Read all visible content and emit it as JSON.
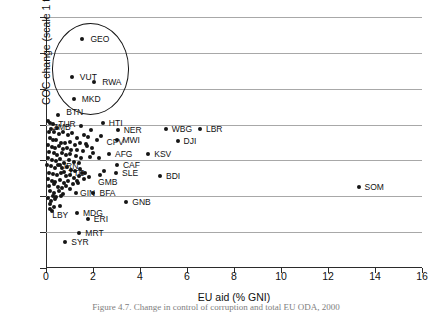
{
  "caption": "Figure 4.7. Change in control of corruption and total EU ODA, 2000",
  "chart_data": {
    "type": "scatter",
    "title": "",
    "xlabel": "EU aid (% GNI)",
    "ylabel": "COC change (scale 1 to 10)",
    "xlim": [
      0,
      16
    ],
    "ylim": [
      -3,
      4
    ],
    "xticks": [
      0,
      2,
      4,
      6,
      8,
      10,
      12,
      14,
      16
    ],
    "yticks": [
      -3,
      -2,
      -1,
      0,
      1,
      2,
      3,
      4
    ],
    "grid": "horizontal",
    "legend": "none",
    "marker": "filled-circle",
    "marker_color": "#151515",
    "annotations": [
      {
        "type": "ellipse",
        "name": "outlier-highlight-ellipse",
        "center_x": 1.9,
        "center_y": 2.55,
        "radius_x": 1.65,
        "radius_y": 1.27
      }
    ],
    "labeled_points": [
      {
        "label": "GEO",
        "x": 1.55,
        "y": 3.38,
        "lx": 8,
        "ly": -4
      },
      {
        "label": "VUT",
        "x": 1.1,
        "y": 2.33,
        "lx": 8,
        "ly": -4
      },
      {
        "label": "RWA",
        "x": 2.05,
        "y": 2.18,
        "lx": 8,
        "ly": -4
      },
      {
        "label": "MKD",
        "x": 1.18,
        "y": 1.71,
        "lx": 8,
        "ly": -4
      },
      {
        "label": "BTN",
        "x": 0.52,
        "y": 1.27,
        "lx": 8,
        "ly": -7
      },
      {
        "label": "TUR",
        "x": 0.18,
        "y": 1.05,
        "lx": 8,
        "ly": -3
      },
      {
        "label": "ZMB",
        "x": 1.48,
        "y": 0.95,
        "lx": -28,
        "ly": -3
      },
      {
        "label": "HTI",
        "x": 2.42,
        "y": 1.04,
        "lx": 6,
        "ly": -4
      },
      {
        "label": "NER",
        "x": 3.05,
        "y": 0.86,
        "lx": 6,
        "ly": -4
      },
      {
        "label": "WBG",
        "x": 5.1,
        "y": 0.88,
        "lx": 6,
        "ly": -4
      },
      {
        "label": "LBR",
        "x": 6.55,
        "y": 0.88,
        "lx": 6,
        "ly": -4
      },
      {
        "label": "CPV",
        "x": 2.32,
        "y": 0.68,
        "lx": 0,
        "ly": 2
      },
      {
        "label": "MWI",
        "x": 3.0,
        "y": 0.58,
        "lx": 6,
        "ly": -4
      },
      {
        "label": "DJI",
        "x": 5.6,
        "y": 0.55,
        "lx": 6,
        "ly": -4
      },
      {
        "label": "AFG",
        "x": 2.68,
        "y": 0.17,
        "lx": 6,
        "ly": -4
      },
      {
        "label": "KSV",
        "x": 4.35,
        "y": 0.17,
        "lx": 6,
        "ly": -4
      },
      {
        "label": "CAF",
        "x": 3.02,
        "y": -0.12,
        "lx": 6,
        "ly": -4
      },
      {
        "label": "SLE",
        "x": 2.98,
        "y": -0.36,
        "lx": 6,
        "ly": -4
      },
      {
        "label": "BDI",
        "x": 4.85,
        "y": -0.43,
        "lx": 6,
        "ly": -4
      },
      {
        "label": "GMB",
        "x": 2.3,
        "y": -0.4,
        "lx": -2,
        "ly": 3
      },
      {
        "label": "TTO",
        "x": 0.78,
        "y": -0.33,
        "lx": 4,
        "ly": -3
      },
      {
        "label": "IRN",
        "x": 0.58,
        "y": -0.13,
        "lx": 4,
        "ly": -3
      },
      {
        "label": "GIN",
        "x": 1.28,
        "y": -0.92,
        "lx": 4,
        "ly": -4
      },
      {
        "label": "BFA",
        "x": 2.02,
        "y": -0.92,
        "lx": 6,
        "ly": -4
      },
      {
        "label": "GNB",
        "x": 3.42,
        "y": -1.17,
        "lx": 6,
        "ly": -4
      },
      {
        "label": "SOM",
        "x": 13.3,
        "y": -0.75,
        "lx": 6,
        "ly": -4
      },
      {
        "label": "LBY",
        "x": 0.18,
        "y": -1.35,
        "lx": 2,
        "ly": 2
      },
      {
        "label": "MDG",
        "x": 1.32,
        "y": -1.48,
        "lx": 6,
        "ly": -4
      },
      {
        "label": "ERI",
        "x": 1.78,
        "y": -1.62,
        "lx": 6,
        "ly": -4
      },
      {
        "label": "MRT",
        "x": 1.42,
        "y": -2.02,
        "lx": 6,
        "ly": -4
      },
      {
        "label": "SYR",
        "x": 0.82,
        "y": -2.28,
        "lx": 6,
        "ly": -4
      }
    ],
    "unlabeled_points": [
      {
        "x": 0.09,
        "y": 1.1
      },
      {
        "x": 0.3,
        "y": 1.02
      },
      {
        "x": 0.22,
        "y": 0.88
      },
      {
        "x": 0.12,
        "y": 0.8
      },
      {
        "x": 0.36,
        "y": 0.78
      },
      {
        "x": 0.55,
        "y": 0.74
      },
      {
        "x": 0.74,
        "y": 0.8
      },
      {
        "x": 0.92,
        "y": 0.7
      },
      {
        "x": 1.12,
        "y": 0.76
      },
      {
        "x": 1.3,
        "y": 0.62
      },
      {
        "x": 1.62,
        "y": 0.7
      },
      {
        "x": 1.8,
        "y": 0.66
      },
      {
        "x": 0.16,
        "y": 0.62
      },
      {
        "x": 0.28,
        "y": 0.58
      },
      {
        "x": 0.44,
        "y": 0.56
      },
      {
        "x": 0.62,
        "y": 0.5
      },
      {
        "x": 0.82,
        "y": 0.48
      },
      {
        "x": 1.02,
        "y": 0.52
      },
      {
        "x": 1.22,
        "y": 0.44
      },
      {
        "x": 1.44,
        "y": 0.5
      },
      {
        "x": 1.7,
        "y": 0.46
      },
      {
        "x": 0.08,
        "y": 0.42
      },
      {
        "x": 0.24,
        "y": 0.38
      },
      {
        "x": 0.4,
        "y": 0.34
      },
      {
        "x": 0.56,
        "y": 0.4
      },
      {
        "x": 0.72,
        "y": 0.32
      },
      {
        "x": 0.9,
        "y": 0.36
      },
      {
        "x": 1.08,
        "y": 0.28
      },
      {
        "x": 1.34,
        "y": 0.3
      },
      {
        "x": 1.56,
        "y": 0.26
      },
      {
        "x": 2.0,
        "y": 0.22
      },
      {
        "x": 0.14,
        "y": 0.24
      },
      {
        "x": 0.32,
        "y": 0.2
      },
      {
        "x": 0.48,
        "y": 0.16
      },
      {
        "x": 0.66,
        "y": 0.22
      },
      {
        "x": 0.86,
        "y": 0.14
      },
      {
        "x": 1.04,
        "y": 0.18
      },
      {
        "x": 1.26,
        "y": 0.12
      },
      {
        "x": 1.5,
        "y": 0.08
      },
      {
        "x": 1.88,
        "y": 0.1
      },
      {
        "x": 0.1,
        "y": 0.06
      },
      {
        "x": 0.26,
        "y": 0.02
      },
      {
        "x": 0.42,
        "y": -0.02
      },
      {
        "x": 0.6,
        "y": 0.04
      },
      {
        "x": 0.78,
        "y": -0.06
      },
      {
        "x": 0.96,
        "y": 0.0
      },
      {
        "x": 1.18,
        "y": -0.04
      },
      {
        "x": 1.4,
        "y": -0.08
      },
      {
        "x": 0.06,
        "y": -0.12
      },
      {
        "x": 0.2,
        "y": -0.16
      },
      {
        "x": 0.38,
        "y": -0.2
      },
      {
        "x": 0.52,
        "y": -0.14
      },
      {
        "x": 0.7,
        "y": -0.22
      },
      {
        "x": 0.88,
        "y": -0.18
      },
      {
        "x": 1.06,
        "y": -0.26
      },
      {
        "x": 1.24,
        "y": -0.3
      },
      {
        "x": 1.46,
        "y": -0.24
      },
      {
        "x": 1.66,
        "y": -0.34
      },
      {
        "x": 0.12,
        "y": -0.34
      },
      {
        "x": 0.3,
        "y": -0.38
      },
      {
        "x": 0.46,
        "y": -0.42
      },
      {
        "x": 0.64,
        "y": -0.36
      },
      {
        "x": 0.84,
        "y": -0.44
      },
      {
        "x": 1.0,
        "y": -0.4
      },
      {
        "x": 1.2,
        "y": -0.48
      },
      {
        "x": 1.42,
        "y": -0.44
      },
      {
        "x": 1.62,
        "y": -0.52
      },
      {
        "x": 1.84,
        "y": -0.46
      },
      {
        "x": 0.08,
        "y": -0.52
      },
      {
        "x": 0.24,
        "y": -0.56
      },
      {
        "x": 0.4,
        "y": -0.6
      },
      {
        "x": 0.58,
        "y": -0.54
      },
      {
        "x": 0.76,
        "y": -0.62
      },
      {
        "x": 0.94,
        "y": -0.58
      },
      {
        "x": 1.14,
        "y": -0.66
      },
      {
        "x": 1.36,
        "y": -0.62
      },
      {
        "x": 0.14,
        "y": -0.7
      },
      {
        "x": 0.34,
        "y": -0.66
      },
      {
        "x": 0.5,
        "y": -0.74
      },
      {
        "x": 0.68,
        "y": -0.78
      },
      {
        "x": 0.86,
        "y": -0.72
      },
      {
        "x": 1.04,
        "y": -0.8
      },
      {
        "x": 0.18,
        "y": -0.86
      },
      {
        "x": 0.36,
        "y": -0.9
      },
      {
        "x": 0.54,
        "y": -0.84
      },
      {
        "x": 0.72,
        "y": -0.94
      },
      {
        "x": 0.28,
        "y": -0.98
      },
      {
        "x": 0.44,
        "y": -1.02
      },
      {
        "x": 0.62,
        "y": -0.98
      },
      {
        "x": 0.1,
        "y": -1.04
      },
      {
        "x": 0.22,
        "y": -1.12
      },
      {
        "x": 0.4,
        "y": -1.08
      },
      {
        "x": 0.16,
        "y": -1.22
      },
      {
        "x": 0.34,
        "y": -1.3
      },
      {
        "x": 0.6,
        "y": -1.26
      },
      {
        "x": 0.26,
        "y": -1.4
      },
      {
        "x": 0.48,
        "y": 0.9
      },
      {
        "x": 1.9,
        "y": 0.84
      },
      {
        "x": 2.16,
        "y": 0.56
      },
      {
        "x": 1.74,
        "y": 0.4
      },
      {
        "x": 1.96,
        "y": 0.34
      },
      {
        "x": 2.24,
        "y": 0.08
      },
      {
        "x": 2.46,
        "y": -0.3
      },
      {
        "x": 1.52,
        "y": -0.36
      },
      {
        "x": 1.3,
        "y": -0.56
      }
    ]
  }
}
